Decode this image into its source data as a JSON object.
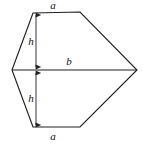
{
  "figure": {
    "kind": "geometry-diagram",
    "background_color": "#ffffff",
    "stroke_color": "#231f20",
    "stroke_width": 1.15,
    "labels": {
      "top_side": "a",
      "bottom_side": "a",
      "middle_diagonal": "b",
      "upper_height": "h",
      "lower_height": "h"
    },
    "label_positions": {
      "top_side": {
        "x": 53,
        "y": 6
      },
      "bottom_side": {
        "x": 53,
        "y": 137
      },
      "middle_diagonal": {
        "x": 69,
        "y": 62
      },
      "upper_height": {
        "x": 31,
        "y": 42
      },
      "lower_height": {
        "x": 31,
        "y": 99
      }
    },
    "polygon_vertices": [
      {
        "name": "top-left",
        "x": 33,
        "y": 13
      },
      {
        "name": "top-right",
        "x": 80,
        "y": 12
      },
      {
        "name": "right-apex",
        "x": 137,
        "y": 70
      },
      {
        "name": "bottom-right",
        "x": 80,
        "y": 127
      },
      {
        "name": "bottom-left",
        "x": 33,
        "y": 127
      },
      {
        "name": "left-vertex",
        "x": 12,
        "y": 70
      }
    ],
    "diagonal_line": {
      "name": "b-diagonal",
      "x1": 12,
      "y1": 70,
      "x2": 137,
      "y2": 70
    },
    "dimension_arrows": [
      {
        "name": "upper-h-arrow",
        "x": 36,
        "y1": 13,
        "y2": 69,
        "double_headed": true
      },
      {
        "name": "lower-h-arrow",
        "x": 36,
        "y1": 71,
        "y2": 127,
        "double_headed": true
      }
    ]
  },
  "chart_data": {
    "type": "diagram",
    "title": "",
    "shape": "hexagon",
    "labeled_segments": [
      {
        "label": "a",
        "role": "top-parallel-side",
        "position": "top"
      },
      {
        "label": "a",
        "role": "bottom-parallel-side",
        "position": "bottom"
      },
      {
        "label": "b",
        "role": "horizontal-diagonal",
        "position": "middle"
      },
      {
        "label": "h",
        "role": "height-upper-trapezoid",
        "position": "upper-left"
      },
      {
        "label": "h",
        "role": "height-lower-trapezoid",
        "position": "lower-left"
      }
    ]
  }
}
